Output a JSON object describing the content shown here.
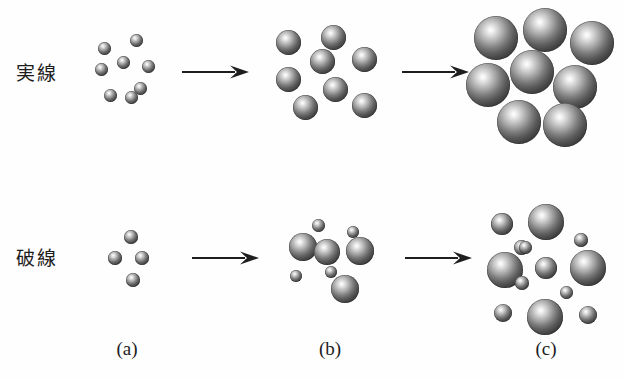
{
  "figure": {
    "title": "",
    "background_color": "#fefefe",
    "sphere_color_center": "#ffffff",
    "sphere_color_edge": "#232323",
    "width": 625,
    "height": 379
  },
  "row_labels": [
    {
      "id": "solid",
      "text": "実線",
      "meaning": "solid line"
    },
    {
      "id": "dashed",
      "text": "破線",
      "meaning": "dashed line"
    }
  ],
  "captions": [
    {
      "id": "a",
      "text": "(a)"
    },
    {
      "id": "b",
      "text": "(b)"
    },
    {
      "id": "c",
      "text": "(c)"
    }
  ],
  "arrows": [
    {
      "id": "solid-a-to-b",
      "glyph": "right-arrow"
    },
    {
      "id": "solid-b-to-c",
      "glyph": "right-arrow"
    },
    {
      "id": "dashed-a-to-b",
      "glyph": "right-arrow"
    },
    {
      "id": "dashed-b-to-c",
      "glyph": "right-arrow"
    }
  ],
  "chart_data": {
    "type": "scatter",
    "title": "",
    "xlabel": "",
    "ylabel": "",
    "rows": [
      {
        "label": "実線",
        "stages": [
          {
            "caption": "(a)",
            "particle_count": 8,
            "sizes": [
              13,
              13,
              13,
              13,
              13,
              13,
              13,
              13
            ],
            "spheres": [
              {
                "cx": 104,
                "cy": 48,
                "d": 13
              },
              {
                "cx": 136,
                "cy": 40,
                "d": 13
              },
              {
                "cx": 101,
                "cy": 69,
                "d": 13
              },
              {
                "cx": 123,
                "cy": 62,
                "d": 13
              },
              {
                "cx": 148,
                "cy": 66,
                "d": 13
              },
              {
                "cx": 140,
                "cy": 88,
                "d": 13
              },
              {
                "cx": 110,
                "cy": 95,
                "d": 13
              },
              {
                "cx": 131,
                "cy": 97,
                "d": 13
              }
            ]
          },
          {
            "caption": "(b)",
            "particle_count": 7,
            "sizes": [
              25,
              25,
              25,
              25,
              25,
              25,
              25
            ],
            "spheres": [
              {
                "cx": 288,
                "cy": 42,
                "d": 25
              },
              {
                "cx": 333,
                "cy": 37,
                "d": 25
              },
              {
                "cx": 322,
                "cy": 61,
                "d": 25
              },
              {
                "cx": 364,
                "cy": 59,
                "d": 25
              },
              {
                "cx": 288,
                "cy": 79,
                "d": 25
              },
              {
                "cx": 335,
                "cy": 89,
                "d": 25
              },
              {
                "cx": 305,
                "cy": 107,
                "d": 25
              },
              {
                "cx": 364,
                "cy": 105,
                "d": 25
              }
            ]
          },
          {
            "caption": "(c)",
            "particle_count": 8,
            "sizes": [
              44,
              44,
              44,
              44,
              44,
              44,
              44,
              44
            ],
            "spheres": [
              {
                "cx": 496,
                "cy": 38,
                "d": 44
              },
              {
                "cx": 545,
                "cy": 30,
                "d": 44
              },
              {
                "cx": 592,
                "cy": 43,
                "d": 44
              },
              {
                "cx": 532,
                "cy": 72,
                "d": 44
              },
              {
                "cx": 488,
                "cy": 85,
                "d": 44
              },
              {
                "cx": 575,
                "cy": 87,
                "d": 44
              },
              {
                "cx": 519,
                "cy": 122,
                "d": 44
              },
              {
                "cx": 565,
                "cy": 125,
                "d": 44
              }
            ]
          }
        ]
      },
      {
        "label": "破線",
        "stages": [
          {
            "caption": "(a)",
            "particle_count": 4,
            "sizes": [
              14,
              14,
              14,
              14
            ],
            "spheres": [
              {
                "cx": 131,
                "cy": 237,
                "d": 14
              },
              {
                "cx": 115,
                "cy": 258,
                "d": 14
              },
              {
                "cx": 142,
                "cy": 258,
                "d": 14
              },
              {
                "cx": 133,
                "cy": 280,
                "d": 14
              }
            ]
          },
          {
            "caption": "(b)",
            "particle_count": 8,
            "sizes": [
              28,
              28,
              28,
              28,
              13,
              12,
              12,
              12
            ],
            "spheres": [
              {
                "cx": 303,
                "cy": 247,
                "d": 28
              },
              {
                "cx": 327,
                "cy": 252,
                "d": 26
              },
              {
                "cx": 360,
                "cy": 251,
                "d": 28
              },
              {
                "cx": 345,
                "cy": 289,
                "d": 28
              },
              {
                "cx": 318,
                "cy": 225,
                "d": 13
              },
              {
                "cx": 353,
                "cy": 232,
                "d": 12
              },
              {
                "cx": 296,
                "cy": 276,
                "d": 12
              },
              {
                "cx": 331,
                "cy": 272,
                "d": 12
              }
            ]
          },
          {
            "caption": "(c)",
            "particle_count": 13,
            "sizes": [
              36,
              36,
              36,
              36,
              22,
              22,
              18,
              18,
              18,
              14,
              14,
              13,
              13
            ],
            "spheres": [
              {
                "cx": 546,
                "cy": 222,
                "d": 36
              },
              {
                "cx": 505,
                "cy": 270,
                "d": 36
              },
              {
                "cx": 588,
                "cy": 268,
                "d": 36
              },
              {
                "cx": 545,
                "cy": 317,
                "d": 36
              },
              {
                "cx": 502,
                "cy": 224,
                "d": 22
              },
              {
                "cx": 546,
                "cy": 268,
                "d": 22
              },
              {
                "cx": 503,
                "cy": 313,
                "d": 18
              },
              {
                "cx": 588,
                "cy": 315,
                "d": 18
              },
              {
                "cx": 521,
                "cy": 247,
                "d": 15
              },
              {
                "cx": 581,
                "cy": 240,
                "d": 14
              },
              {
                "cx": 522,
                "cy": 283,
                "d": 14
              },
              {
                "cx": 566,
                "cy": 292,
                "d": 13
              },
              {
                "cx": 525,
                "cy": 247,
                "d": 13
              }
            ]
          }
        ]
      }
    ]
  }
}
